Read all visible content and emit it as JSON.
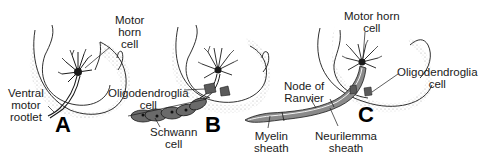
{
  "figure": {
    "panels": [
      {
        "letter": "A",
        "labels": {
          "motor_horn_cell": [
            "Motor",
            "horn",
            "cell"
          ],
          "ventral_motor_rootlet": [
            "Ventral",
            "motor",
            "rootlet"
          ]
        }
      },
      {
        "letter": "B",
        "labels": {
          "oligodendroglia_cell": [
            "Oligodendroglia",
            "cell"
          ],
          "schwann_cell": [
            "Schwann",
            "cell"
          ]
        }
      },
      {
        "letter": "C",
        "labels": {
          "motor_horn_cell": [
            "Motor horn",
            "cell"
          ],
          "oligodendroglia_cell": [
            "Oligodendroglia",
            "cell"
          ],
          "node_of_ranvier": [
            "Node of",
            "Ranvier"
          ],
          "myelin_sheath": [
            "Myelin",
            "sheath"
          ],
          "neurilemma_sheath": [
            "Neurilemma",
            "sheath"
          ]
        }
      }
    ],
    "colors": {
      "line": "#1a1a1a",
      "stipple": "#9a9a9a",
      "sheath_fill": "#8a8a8a",
      "background": "#ffffff"
    }
  }
}
